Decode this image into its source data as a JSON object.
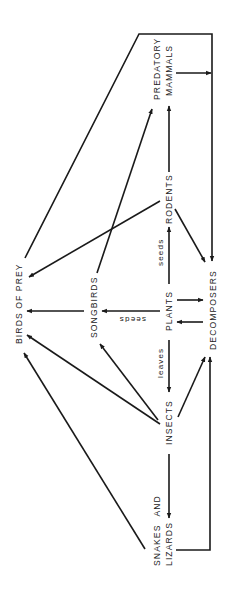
{
  "diagram": {
    "type": "food web",
    "orientation": "rotated 90 degrees counter-clockwise",
    "colors": {
      "line": "#1a1a1a",
      "text": "#222222",
      "background": "#ffffff"
    },
    "nodes": {
      "predatory_mammals": {
        "line1": "PREDATORY",
        "line2": "MAMMALS"
      },
      "rodents": "RODENTS",
      "birds_of_prey": "BIRDS OF PREY",
      "songbirds": "SONGBIRDS",
      "plants": "PLANTS",
      "decomposers": "DECOMPOSERS",
      "insects": "INSECTS",
      "snakes_and_lizards": {
        "line1": "SNAKES AND",
        "line2": "LIZARDS"
      }
    },
    "edge_labels": {
      "seeds": "seeds",
      "seeds_songbirds": "seeds",
      "leaves": "leaves"
    },
    "edges": [
      {
        "from": "PLANTS",
        "to": "RODENTS",
        "label": "seeds"
      },
      {
        "from": "PLANTS",
        "to": "SONGBIRDS",
        "label": "seeds"
      },
      {
        "from": "PLANTS",
        "to": "INSECTS",
        "label": "leaves"
      },
      {
        "from": "PLANTS",
        "to": "DECOMPOSERS"
      },
      {
        "from": "DECOMPOSERS",
        "to": "PLANTS"
      },
      {
        "from": "RODENTS",
        "to": "PREDATORY MAMMALS"
      },
      {
        "from": "RODENTS",
        "to": "BIRDS OF PREY"
      },
      {
        "from": "RODENTS",
        "to": "DECOMPOSERS"
      },
      {
        "from": "SONGBIRDS",
        "to": "PREDATORY MAMMALS"
      },
      {
        "from": "SONGBIRDS",
        "to": "BIRDS OF PREY"
      },
      {
        "from": "INSECTS",
        "to": "SONGBIRDS"
      },
      {
        "from": "INSECTS",
        "to": "BIRDS OF PREY"
      },
      {
        "from": "INSECTS",
        "to": "SNAKES AND LIZARDS"
      },
      {
        "from": "INSECTS",
        "to": "DECOMPOSERS"
      },
      {
        "from": "SNAKES AND LIZARDS",
        "to": "BIRDS OF PREY"
      },
      {
        "from": "SNAKES AND LIZARDS",
        "to": "DECOMPOSERS"
      },
      {
        "from": "PREDATORY MAMMALS",
        "to": "DECOMPOSERS"
      },
      {
        "from": "BIRDS OF PREY",
        "to": "DECOMPOSERS"
      }
    ]
  }
}
